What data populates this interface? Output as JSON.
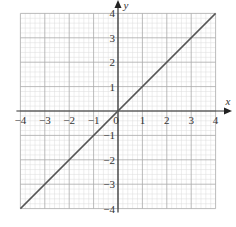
{
  "chart_data": {
    "type": "line",
    "title": "",
    "xlabel": "x",
    "ylabel": "y",
    "xlim": [
      -4,
      4
    ],
    "ylim": [
      -4,
      4
    ],
    "grid": true,
    "minor_divisions_per_unit": 5,
    "x_ticks": [
      "-4",
      "-3",
      "-2",
      "-1",
      "0",
      "1",
      "2",
      "3",
      "4"
    ],
    "y_ticks": [
      "-4",
      "-3",
      "-2",
      "-1",
      "1",
      "2",
      "3",
      "4"
    ],
    "origin_label": "0",
    "series": [
      {
        "name": "y = x",
        "x": [
          -4,
          4
        ],
        "y": [
          -4,
          4
        ],
        "color": "#555555"
      }
    ]
  }
}
